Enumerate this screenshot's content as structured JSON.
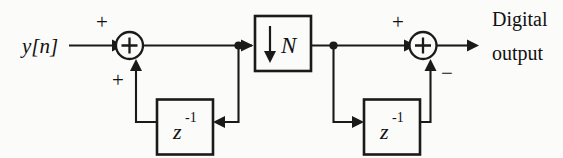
{
  "figure": {
    "stroke_color": "#1a1a1a",
    "background_color": "#fbfbfa"
  },
  "input": {
    "label": "y[n]"
  },
  "output": {
    "line1": "Digital",
    "line2": "output"
  },
  "adders": {
    "left": {
      "name": "accumulator-adder",
      "symbol": "+",
      "sign_input_left": "+",
      "sign_input_bottom": "+"
    },
    "right": {
      "name": "difference-adder",
      "symbol": "+",
      "sign_input_left": "+",
      "sign_input_bottom": "−"
    }
  },
  "blocks": {
    "downsampler": {
      "name": "downsample-block",
      "arrow_glyph": "↓",
      "factor_label": "N"
    },
    "delay_left": {
      "name": "delay-block-left",
      "base": "z",
      "exponent": "-1"
    },
    "delay_right": {
      "name": "delay-block-right",
      "base": "z",
      "exponent": "-1"
    }
  }
}
